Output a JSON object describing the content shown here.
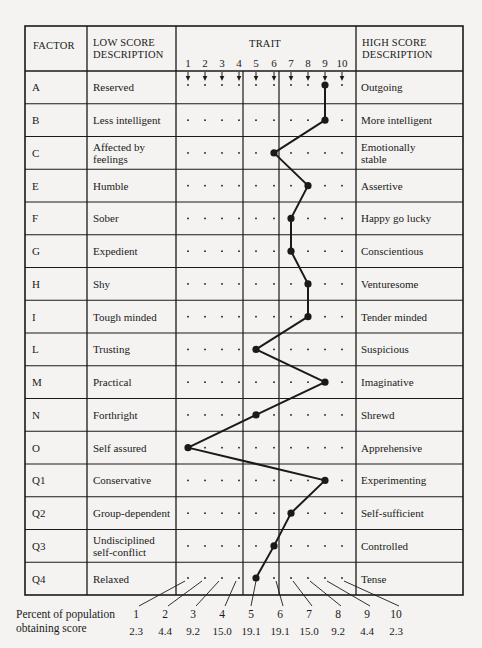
{
  "chart_data": {
    "type": "line",
    "title": "",
    "header": {
      "factor": "FACTOR",
      "low_score_line1": "LOW SCORE",
      "low_score_line2": "DESCRIPTION",
      "trait": "TRAIT",
      "high_score_line1": "HIGH SCORE",
      "high_score_line2": "DESCRIPTION"
    },
    "scale": [
      "1",
      "2",
      "3",
      "4",
      "5",
      "6",
      "7",
      "8",
      "9",
      "10"
    ],
    "rows": [
      {
        "factor": "A",
        "low": [
          "Reserved"
        ],
        "high": [
          "Outgoing"
        ],
        "score": 9
      },
      {
        "factor": "B",
        "low": [
          "Less intelligent"
        ],
        "high": [
          "More intelligent"
        ],
        "score": 9
      },
      {
        "factor": "C",
        "low": [
          "Affected by",
          "feelings"
        ],
        "high": [
          "Emotionally",
          "stable"
        ],
        "score": 6
      },
      {
        "factor": "E",
        "low": [
          "Humble"
        ],
        "high": [
          "Assertive"
        ],
        "score": 8
      },
      {
        "factor": "F",
        "low": [
          "Sober"
        ],
        "high": [
          "Happy go lucky"
        ],
        "score": 7
      },
      {
        "factor": "G",
        "low": [
          "Expedient"
        ],
        "high": [
          "Conscientious"
        ],
        "score": 7
      },
      {
        "factor": "H",
        "low": [
          "Shy"
        ],
        "high": [
          "Venturesome"
        ],
        "score": 8
      },
      {
        "factor": "I",
        "low": [
          "Tough minded"
        ],
        "high": [
          "Tender minded"
        ],
        "score": 8
      },
      {
        "factor": "L",
        "low": [
          "Trusting"
        ],
        "high": [
          "Suspicious"
        ],
        "score": 5
      },
      {
        "factor": "M",
        "low": [
          "Practical"
        ],
        "high": [
          "Imaginative"
        ],
        "score": 9
      },
      {
        "factor": "N",
        "low": [
          "Forthright"
        ],
        "high": [
          "Shrewd"
        ],
        "score": 5
      },
      {
        "factor": "O",
        "low": [
          "Self assured"
        ],
        "high": [
          "Apprehensive"
        ],
        "score": 1
      },
      {
        "factor": "Q1",
        "low": [
          "Conservative"
        ],
        "high": [
          "Experimenting"
        ],
        "score": 9
      },
      {
        "factor": "Q2",
        "low": [
          "Group-dependent"
        ],
        "high": [
          "Self-sufficient"
        ],
        "score": 7
      },
      {
        "factor": "Q3",
        "low": [
          "Undisciplined",
          "self-conflict"
        ],
        "high": [
          "Controlled"
        ],
        "score": 6
      },
      {
        "factor": "Q4",
        "low": [
          "Relaxed"
        ],
        "high": [
          "Tense"
        ],
        "score": 5
      }
    ],
    "population": {
      "label_line1": "Percent of population",
      "label_line2": "obtaining score",
      "scores": [
        "1",
        "2",
        "3",
        "4",
        "5",
        "6",
        "7",
        "8",
        "9",
        "10"
      ],
      "percents": [
        "2.3",
        "4.4",
        "9.2",
        "15.0",
        "19.1",
        "19.1",
        "15.0",
        "9.2",
        "4.4",
        "2.3"
      ]
    },
    "xlabel": "TRAIT",
    "ylabel": "FACTOR",
    "xlim": [
      1,
      10
    ],
    "grid": true,
    "colors": {
      "ink": "#1a1a1a",
      "paper": "#f4f3f1"
    }
  }
}
